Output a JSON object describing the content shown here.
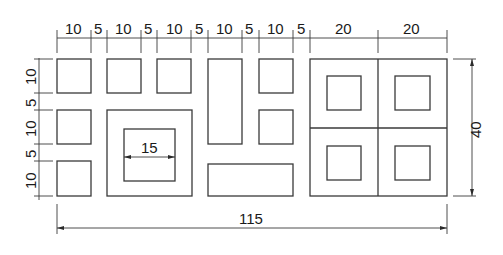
{
  "drawing": {
    "title": "Block with rectangular openings — dimensioned drawing",
    "top_dims": [
      "10",
      "5",
      "10",
      "5",
      "10",
      "5",
      "10",
      "5",
      "10",
      "5",
      "20",
      "20"
    ],
    "left_dims": [
      "10",
      "5",
      "10",
      "5",
      "10"
    ],
    "inner_dim": "15",
    "right_dim": "40",
    "bottom_dim": "115",
    "stroke_color": "#3a3a3a",
    "background": "#ffffff"
  }
}
